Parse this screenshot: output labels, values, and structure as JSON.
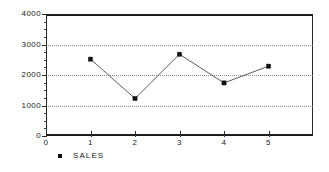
{
  "chart_data": {
    "type": "line",
    "title": "",
    "subtitle": "",
    "xlabel": "",
    "ylabel": "",
    "x": [
      1,
      2,
      3,
      4,
      5
    ],
    "categories": [
      "1",
      "2",
      "3",
      "4",
      "5"
    ],
    "series": [
      {
        "name": "SALES",
        "values": [
          2520,
          1230,
          2680,
          1740,
          2290
        ],
        "marker": "filled-square",
        "marker_color": "#111111",
        "line_color": "#4a4a4a"
      }
    ],
    "xlim": [
      0,
      6
    ],
    "ylim": [
      0,
      4000
    ],
    "x_ticks": [
      0,
      1,
      2,
      3,
      4,
      5
    ],
    "x_tick_labels": [
      "0",
      "1",
      "2",
      "3",
      "4",
      "5"
    ],
    "y_ticks": [
      0,
      1000,
      2000,
      3000,
      4000
    ],
    "y_tick_labels": [
      "4000",
      "3000",
      "2000",
      "1000",
      "0"
    ],
    "y_minor_tick_step": 250,
    "grid": true,
    "grid_axis": "y",
    "grid_style": "dotted",
    "legend": {
      "position": "below-left",
      "entries": [
        {
          "label": "SALES",
          "marker": "filled-square",
          "color": "#111111"
        }
      ]
    },
    "frame": true,
    "background_color": "#ffffff",
    "axis_color": "#2a2a2a",
    "grid_color": "#8a8a8a"
  }
}
